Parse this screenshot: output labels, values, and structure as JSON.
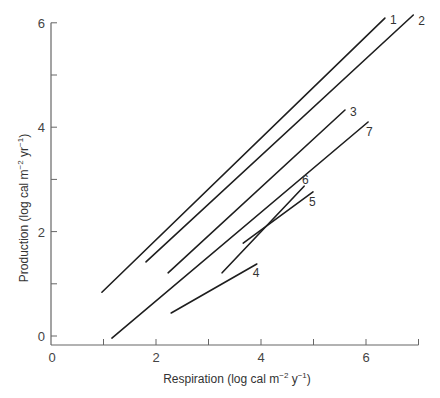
{
  "chart_data": {
    "type": "line",
    "title": "",
    "xlabel": "Respiration (log cal m^-2 y^-1)",
    "ylabel": "Production (log cal m^-2 yr^-1)",
    "xlabel_parts": {
      "main": "Respiration (log cal m",
      "exp1": "−2",
      "mid": " y",
      "exp2": "−1",
      "end": ")"
    },
    "ylabel_parts": {
      "main": "Production (log cal m",
      "exp1": "−2",
      "mid": " yr",
      "exp2": "−1",
      "end": ")"
    },
    "xlim": [
      0,
      7
    ],
    "ylim": [
      -0.3,
      6
    ],
    "x_ticks": [
      0,
      1,
      2,
      3,
      4,
      5,
      6,
      7
    ],
    "x_tick_labels": {
      "0": "0",
      "2": "2",
      "4": "4",
      "6": "6"
    },
    "y_ticks": [
      0,
      1,
      2,
      3,
      4,
      5,
      6
    ],
    "y_tick_labels": {
      "0": "0",
      "2": "2",
      "4": "4",
      "6": "6"
    },
    "grid": false,
    "legend": "inline numeric labels at line ends",
    "series": [
      {
        "name": "1",
        "x": [
          0.97,
          6.36
        ],
        "y": [
          0.84,
          6.09
        ]
      },
      {
        "name": "2",
        "x": [
          1.81,
          6.9
        ],
        "y": [
          1.42,
          6.15
        ]
      },
      {
        "name": "3",
        "x": [
          2.23,
          5.6
        ],
        "y": [
          1.21,
          4.33
        ]
      },
      {
        "name": "4",
        "x": [
          2.29,
          3.92
        ],
        "y": [
          0.44,
          1.38
        ]
      },
      {
        "name": "5",
        "x": [
          3.66,
          4.99
        ],
        "y": [
          1.78,
          2.76
        ]
      },
      {
        "name": "6",
        "x": [
          3.26,
          4.82
        ],
        "y": [
          1.21,
          2.87
        ]
      },
      {
        "name": "7",
        "x": [
          1.16,
          6.04
        ],
        "y": [
          -0.04,
          4.1
        ]
      }
    ],
    "series_label_offsets": {
      "1": [
        5,
        6
      ],
      "2": [
        5,
        10
      ],
      "3": [
        5,
        6
      ],
      "4": [
        -4,
        13
      ],
      "5": [
        -4,
        14
      ],
      "6": [
        -2,
        -2
      ],
      "7": [
        -2,
        14
      ]
    }
  },
  "colors": {
    "axis": "#666666",
    "line": "#1e1e1e",
    "text": "#3a3a3a"
  }
}
